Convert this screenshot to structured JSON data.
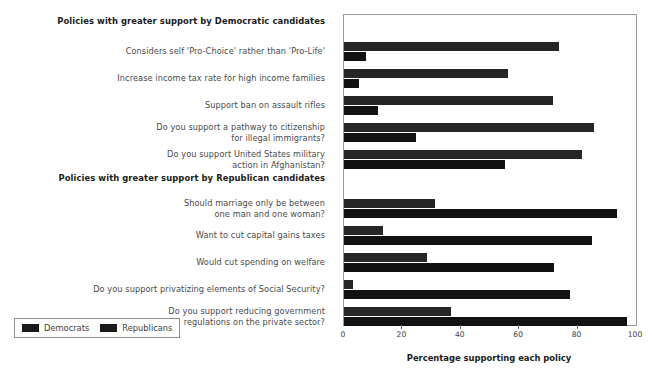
{
  "chart_data": {
    "type": "bar",
    "orientation": "horizontal",
    "title": "",
    "xlabel": "Percentage supporting each policy",
    "ylabel": "",
    "xlim": [
      0,
      100
    ],
    "xticks": [
      0,
      20,
      40,
      60,
      80,
      100
    ],
    "grid": false,
    "legend_position": "bottom-left",
    "legend": [
      "Democrats",
      "Republicans"
    ],
    "series": [
      {
        "name": "Democrats",
        "color": "#262626"
      },
      {
        "name": "Republicans",
        "color": "#111111"
      }
    ],
    "groups": [
      {
        "header": "Policies with greater support by Democratic candidates",
        "rows": [
          {
            "label": "Considers self 'Pro-Choice' rather than 'Pro-Life'",
            "democrats": 73.5,
            "republicans": 7.5
          },
          {
            "label": "Increase income tax rate for high income families",
            "democrats": 56.0,
            "republicans": 5.0
          },
          {
            "label": "Support ban on assault rifles",
            "democrats": 71.5,
            "republicans": 11.5
          },
          {
            "label": "Do you support a pathway to citizenship for illegal immigrants?",
            "democrats": 85.5,
            "republicans": 24.5
          },
          {
            "label": "Do you support United States military action in Afghanistan?",
            "democrats": 81.5,
            "republicans": 55.0
          }
        ]
      },
      {
        "header": "Policies with greater support by Republican candidates",
        "rows": [
          {
            "label": "Should marriage only be between one man and one woman?",
            "democrats": 31.0,
            "republicans": 93.5
          },
          {
            "label": "Want to cut capital gains taxes",
            "democrats": 13.5,
            "republicans": 85.0
          },
          {
            "label": "Would cut spending on welfare",
            "democrats": 28.5,
            "republicans": 72.0
          },
          {
            "label": "Do you support privatizing elements of Social Security?",
            "democrats": 3.0,
            "republicans": 77.5
          },
          {
            "label": "Do you support reducing government regulations on the private sector?",
            "democrats": 36.5,
            "republicans": 97.0
          }
        ]
      }
    ]
  },
  "labels": {
    "group_democratic": "Policies with greater support by Democratic candidates",
    "group_republican": "Policies with greater support by Republican candidates",
    "rows": [
      "Considers self 'Pro-Choice' rather than 'Pro-Life'",
      "Increase income tax rate for high income families",
      "Support ban on assault rifles",
      "Do you support a pathway to citizenship<br>for illegal immigrants?",
      "Do you support United States military<br>action in Afghanistan?",
      "Should marriage only be between<br>one man and one woman?",
      "Want to cut capital gains taxes",
      "Would cut spending on welfare",
      "Do you support privatizing elements of Social Security?",
      "Do you support reducing government<br>regulations on the private sector?"
    ]
  },
  "axis": {
    "title": "Percentage supporting each policy",
    "ticks": [
      "0",
      "20",
      "40",
      "60",
      "80",
      "100"
    ]
  },
  "legend": {
    "democrats": "Democrats",
    "republicans": "Republicans"
  }
}
